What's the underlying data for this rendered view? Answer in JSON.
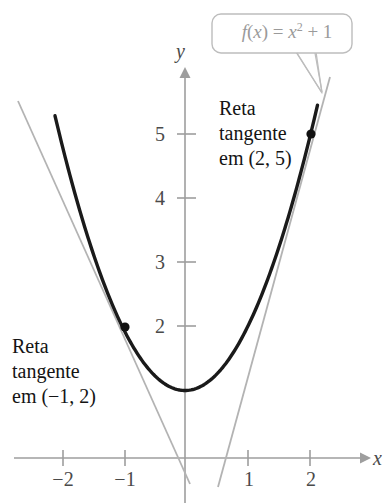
{
  "figure": {
    "title": "",
    "callout": {
      "label": "f(x) = x² + 1",
      "function_name": "f",
      "variable": "x",
      "expression": "x^2 + 1",
      "color": "#9a9a9a"
    },
    "annotations": [
      {
        "id": "tangent-at-2-5",
        "lines": [
          "Reta",
          "tangente",
          "em (2, 5)"
        ],
        "full_text": "Reta tangente em (2, 5)",
        "point_label": "(2, 5)"
      },
      {
        "id": "tangent-at-neg1-2",
        "lines": [
          "Reta",
          "tangente",
          "em (−1, 2)"
        ],
        "full_text": "Reta tangente em (−1, 2)",
        "point_label": "(−1, 2)"
      }
    ],
    "axis_names": {
      "x": "x",
      "y": "y"
    },
    "colors": {
      "curve": "#1a1a1a",
      "tangent": "#b3b3b3",
      "axis": "#9e9e9e",
      "text": "#141414",
      "tick_text": "#4a4a4a",
      "callout_stroke": "#bdbdbd",
      "point": "#111111",
      "background": "#ffffff"
    }
  },
  "chart_data": {
    "type": "line",
    "title": "",
    "xlabel": "x",
    "ylabel": "y",
    "grid": false,
    "legend": "none",
    "xlim": [
      -2.65,
      2.85
    ],
    "ylim": [
      -0.6,
      6.1
    ],
    "xticks": [
      -2,
      -1,
      1,
      2
    ],
    "xtick_labels": [
      "−2",
      "−1",
      "1",
      "2"
    ],
    "yticks": [
      2,
      3,
      4,
      5
    ],
    "ytick_labels": [
      "2",
      "3",
      "4",
      "5"
    ],
    "series": [
      {
        "name": "f(x) = x^2 + 1",
        "type": "curve",
        "equation": "y = x^2 + 1",
        "color": "#1a1a1a",
        "x_range": [
          -2.08,
          2.12
        ],
        "points": [
          {
            "x": -2.08,
            "y": 5.33
          },
          {
            "x": -1.5,
            "y": 3.25
          },
          {
            "x": -1.0,
            "y": 2.0
          },
          {
            "x": -0.5,
            "y": 1.25
          },
          {
            "x": 0.0,
            "y": 1.0
          },
          {
            "x": 0.5,
            "y": 1.25
          },
          {
            "x": 1.0,
            "y": 2.0
          },
          {
            "x": 1.5,
            "y": 3.25
          },
          {
            "x": 2.0,
            "y": 5.0
          },
          {
            "x": 2.12,
            "y": 5.49
          }
        ]
      },
      {
        "name": "Reta tangente em (-1, 2)",
        "type": "line",
        "equation": "y = -2x",
        "slope": -2,
        "intercept": 0,
        "color": "#b3b3b3",
        "x_range": [
          -2.65,
          0.08
        ]
      },
      {
        "name": "Reta tangente em (2, 5)",
        "type": "line",
        "equation": "y = 4x - 3",
        "slope": 4,
        "intercept": -3,
        "color": "#b3b3b3",
        "x_range": [
          0.52,
          2.3
        ]
      }
    ],
    "markers": [
      {
        "x": -1,
        "y": 2,
        "label": "(−1, 2)",
        "color": "#111111"
      },
      {
        "x": 2,
        "y": 5,
        "label": "(2, 5)",
        "color": "#111111"
      }
    ],
    "annotations": [
      {
        "text": "f(x) = x² + 1",
        "kind": "callout",
        "target": {
          "x": 2.17,
          "y": 5.7
        }
      },
      {
        "text": "Reta tangente em (2, 5)",
        "kind": "text",
        "at": {
          "x": 0.55,
          "y": 5.6
        }
      },
      {
        "text": "Reta tangente em (−1, 2)",
        "kind": "text",
        "at": {
          "x": -2.7,
          "y": 2.9
        }
      }
    ]
  }
}
